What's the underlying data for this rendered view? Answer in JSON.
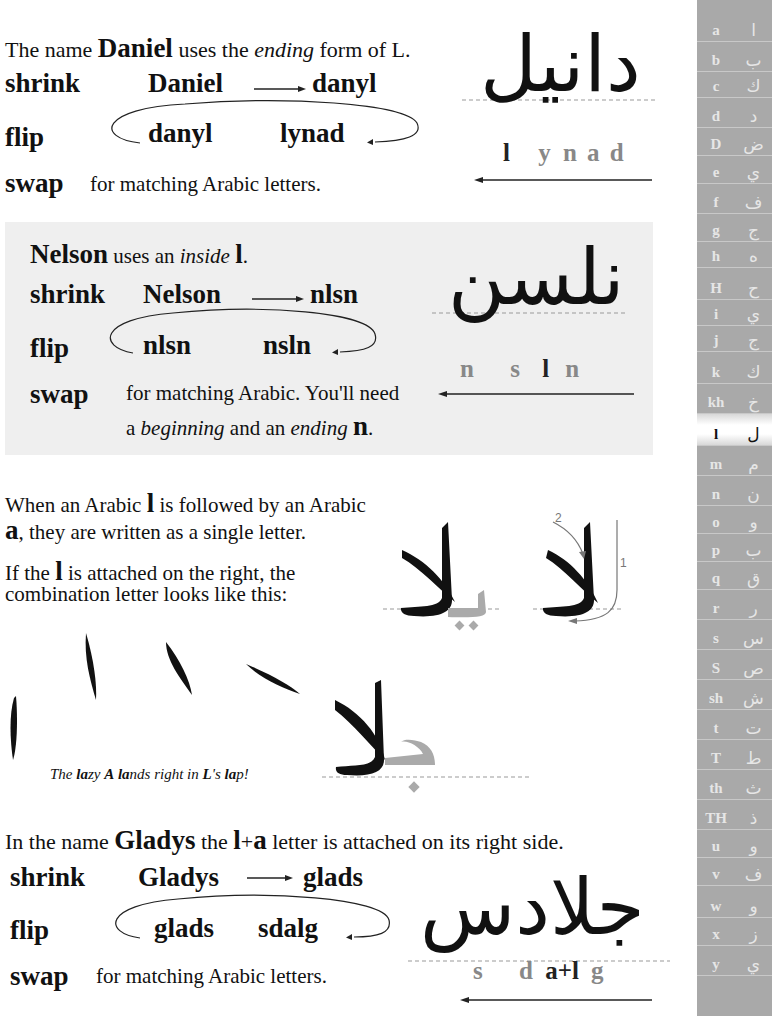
{
  "section1": {
    "intro": {
      "pre": "The name ",
      "name": "Daniel",
      "mid": " uses the ",
      "em": "ending",
      "post": " form of L."
    },
    "shrink": {
      "label": "shrink",
      "from": "Daniel",
      "to": "danyl"
    },
    "flip": {
      "label": "flip",
      "from": "danyl",
      "to": "lynad"
    },
    "swap": {
      "label": "swap",
      "text": "for matching Arabic letters."
    },
    "arabic": "دانيل",
    "letters": [
      "l",
      "y",
      "n",
      "a",
      "d"
    ]
  },
  "section2": {
    "intro": {
      "name": "Nelson",
      "mid": " uses an ",
      "em": "inside",
      "letter": "l",
      "post": "."
    },
    "shrink": {
      "label": "shrink",
      "from": "Nelson",
      "to": "nlsn"
    },
    "flip": {
      "label": "flip",
      "from": "nlsn",
      "to": "nsln"
    },
    "swap": {
      "label": "swap",
      "line1": "for matching Arabic. You'll need",
      "line2_pre": "a ",
      "line2_em1": "beginning",
      "line2_mid": " and an ",
      "line2_em2": "ending",
      "line2_letter": "n",
      "line2_post": "."
    },
    "arabic": "نلسن",
    "letters": [
      "n",
      "s",
      "l",
      "n"
    ]
  },
  "section3": {
    "p1": {
      "pre": "When an Arabic ",
      "l": "l",
      "mid": " is followed by an Arabic",
      "a": "a",
      "post": ", they are written as a single letter."
    },
    "p2": {
      "pre": "If the ",
      "l": "l",
      "post1": " is attached on the right, the",
      "post2": "combination letter looks like this:"
    },
    "stroke_numbers": [
      "1",
      "2"
    ],
    "lam_alef": "لا",
    "ya_lam_alef": "يلا",
    "caption": {
      "p1": "The ",
      "b1": "la",
      "p2": "zy ",
      "b2": "A",
      "p3": " ",
      "b3": "la",
      "p4": "nds right in ",
      "b4": "L",
      "p5": "'s ",
      "b5": "la",
      "p6": "p!"
    },
    "jim_lam_alef": "جلا"
  },
  "section4": {
    "intro": {
      "pre": "In the name ",
      "name": "Gladys",
      "mid": " the ",
      "combo_l": "l",
      "plus": "+",
      "combo_a": "a",
      "post": " letter is attached on its right side."
    },
    "shrink": {
      "label": "shrink",
      "from": "Gladys",
      "to": "glads"
    },
    "flip": {
      "label": "flip",
      "from": "glads",
      "to": "sdalg"
    },
    "swap": {
      "label": "swap",
      "text": "for matching Arabic letters."
    },
    "arabic": "جلادس",
    "letters": {
      "s": "s",
      "d": "d",
      "combo": "a+l",
      "g": "g"
    }
  },
  "sidebar": {
    "rows": [
      {
        "lat": "a",
        "ara": "ا"
      },
      {
        "lat": "b",
        "ara": "ب"
      },
      {
        "lat": "c",
        "ara": "ك"
      },
      {
        "lat": "d",
        "ara": "د"
      },
      {
        "lat": "D",
        "ara": "ض"
      },
      {
        "lat": "e",
        "ara": "ي"
      },
      {
        "lat": "f",
        "ara": "ف"
      },
      {
        "lat": "g",
        "ara": "ج"
      },
      {
        "lat": "h",
        "ara": "ه"
      },
      {
        "lat": "H",
        "ara": "ح"
      },
      {
        "lat": "i",
        "ara": "ي"
      },
      {
        "lat": "j",
        "ara": "ج"
      },
      {
        "lat": "k",
        "ara": "ك"
      },
      {
        "lat": "kh",
        "ara": "خ"
      },
      {
        "lat": "l",
        "ara": "ل"
      },
      {
        "lat": "m",
        "ara": "م"
      },
      {
        "lat": "n",
        "ara": "ن"
      },
      {
        "lat": "o",
        "ara": "و"
      },
      {
        "lat": "p",
        "ara": "ب"
      },
      {
        "lat": "q",
        "ara": "ق"
      },
      {
        "lat": "r",
        "ara": "ر"
      },
      {
        "lat": "s",
        "ara": "س"
      },
      {
        "lat": "S",
        "ara": "ص"
      },
      {
        "lat": "sh",
        "ara": "ش"
      },
      {
        "lat": "t",
        "ara": "ت"
      },
      {
        "lat": "T",
        "ara": "ط"
      },
      {
        "lat": "th",
        "ara": "ث"
      },
      {
        "lat": "TH",
        "ara": "ذ"
      },
      {
        "lat": "u",
        "ara": "و"
      },
      {
        "lat": "v",
        "ara": "ف"
      },
      {
        "lat": "w",
        "ara": "و"
      },
      {
        "lat": "x",
        "ara": "ز"
      },
      {
        "lat": "y",
        "ara": "ي"
      }
    ],
    "active": "l",
    "colors": {
      "bg": "#a9a9a9",
      "text": "#e6e6e6",
      "active_bg": "#ffffff"
    }
  }
}
